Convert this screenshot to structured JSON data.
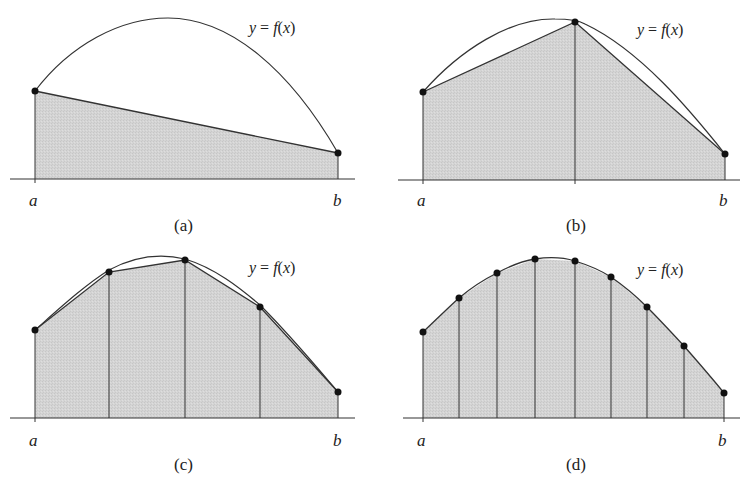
{
  "function_label": "y = f(x)",
  "function_label_parts": {
    "y": "y",
    "eq": " = ",
    "f": "f",
    "open": "(",
    "x": "x",
    "close": ")"
  },
  "colors": {
    "fill": "#d2d2d2",
    "stroke": "#333333",
    "point": "#111111"
  },
  "panels": [
    {
      "id": "a",
      "caption": "(a)",
      "left_label": "a",
      "right_label": "b",
      "n_intervals": 1,
      "points": [
        [
          35,
          91
        ],
        [
          338,
          153
        ]
      ]
    },
    {
      "id": "b",
      "caption": "(b)",
      "left_label": "a",
      "right_label": "b",
      "n_intervals": 2,
      "points": [
        [
          423,
          92
        ],
        [
          575,
          22
        ],
        [
          725,
          154
        ]
      ]
    },
    {
      "id": "c",
      "caption": "(c)",
      "left_label": "a",
      "right_label": "b",
      "n_intervals": 4,
      "points": [
        [
          35,
          330
        ],
        [
          109,
          272
        ],
        [
          185,
          260
        ],
        [
          260,
          307
        ],
        [
          338,
          392
        ]
      ]
    },
    {
      "id": "d",
      "caption": "(d)",
      "left_label": "a",
      "right_label": "b",
      "n_intervals": 8,
      "points": [
        [
          423,
          332
        ],
        [
          459,
          298
        ],
        [
          497,
          273
        ],
        [
          535,
          259
        ],
        [
          575,
          261
        ],
        [
          611,
          277
        ],
        [
          647,
          307
        ],
        [
          684,
          346
        ],
        [
          724,
          393
        ]
      ]
    }
  ]
}
